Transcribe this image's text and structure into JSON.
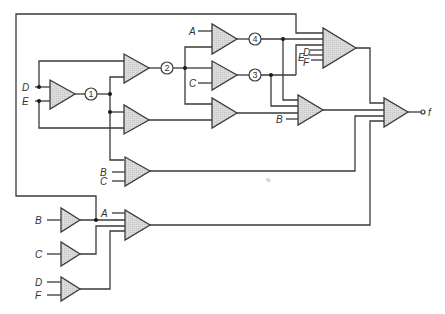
{
  "diagram": {
    "type": "logic-circuit",
    "colors": {
      "line": "#3a3a3a",
      "gate_fill": "#d6d6d6",
      "background": "#ffffff"
    },
    "inputs": {
      "D_main": "D",
      "E_main": "E",
      "A_top": "A",
      "C_top": "C",
      "D_big": "D",
      "E_big": "E",
      "F_big": "F",
      "B_mid": "B",
      "B_low": "B",
      "C_low": "C",
      "A_bottom": "A",
      "B_buf": "B",
      "C_buf": "C",
      "D_buf": "D",
      "F_buf": "F"
    },
    "nodes": {
      "n1": "1",
      "n2": "2",
      "n3": "3",
      "n4": "4"
    },
    "output": {
      "label": "f"
    },
    "artifact": "%"
  }
}
